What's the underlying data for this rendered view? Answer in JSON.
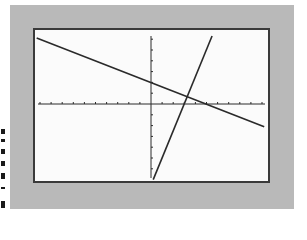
{
  "chart_data": {
    "type": "line",
    "title": "",
    "xlabel": "",
    "ylabel": "",
    "xlim": [
      -10,
      10
    ],
    "ylim": [
      -7,
      7
    ],
    "grid": false,
    "x_tick_step": 1,
    "y_tick_step": 1,
    "series": [
      {
        "name": "line-1",
        "equation": "y = -0.4x + 2",
        "slope": -0.4,
        "intercept": 2,
        "x": [
          -10.3,
          10.2
        ],
        "y": [
          6.1,
          -2.1
        ]
      },
      {
        "name": "line-2",
        "equation": "y = 2.5x - 7.5",
        "slope": 2.5,
        "intercept": -7.5,
        "x": [
          0.2,
          5.5
        ],
        "y": [
          -7.0,
          6.3
        ]
      }
    ],
    "annotations": [
      {
        "label": "intersection",
        "x": 3.28,
        "y": 0.69
      }
    ]
  },
  "colors": {
    "background": "#b9b9b9",
    "screen": "#fbfbfb",
    "line": "#2a2a2a",
    "border": "#3a3a3a"
  }
}
